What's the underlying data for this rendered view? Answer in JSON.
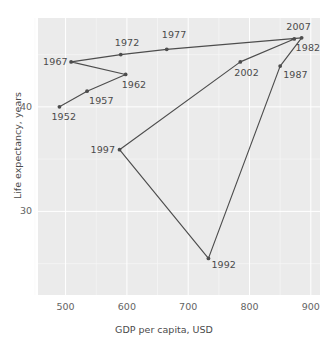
{
  "chart_data": {
    "type": "line",
    "title": "",
    "xlabel": "GDP per capita, USD",
    "ylabel": "Life expectancy, years",
    "xlim": [
      455,
      915
    ],
    "ylim": [
      22.0,
      48.5
    ],
    "xticks": [
      500,
      600,
      700,
      800,
      900
    ],
    "yticks": [
      30,
      40
    ],
    "grid": true,
    "legend": "none",
    "marker": "filled-circle",
    "series_color": "#4d4d4d",
    "plot_background": "#ebebeb",
    "gridline_color": "#ffffff",
    "points": [
      {
        "label": "1952",
        "x": 490,
        "y": 40.0,
        "label_dx": -8,
        "label_dy": 10
      },
      {
        "label": "1957",
        "x": 535,
        "y": 41.5,
        "label_dx": 2,
        "label_dy": 10
      },
      {
        "label": "1962",
        "x": 598,
        "y": 43.1,
        "label_dx": -4,
        "label_dy": 11
      },
      {
        "label": "1967",
        "x": 509,
        "y": 44.3,
        "label_dx": -28,
        "label_dy": 0
      },
      {
        "label": "1972",
        "x": 590,
        "y": 45.0,
        "label_dx": -6,
        "label_dy": -12
      },
      {
        "label": "1977",
        "x": 665,
        "y": 45.5,
        "label_dx": -5,
        "label_dy": -14
      },
      {
        "label": "1982",
        "x": 885,
        "y": 46.6,
        "label_dx": -6,
        "label_dy": 10
      },
      {
        "label": "1987",
        "x": 850,
        "y": 43.9,
        "label_dx": 3,
        "label_dy": 9
      },
      {
        "label": "1992",
        "x": 733,
        "y": 25.5,
        "label_dx": 3,
        "label_dy": 7
      },
      {
        "label": "1997",
        "x": 588,
        "y": 35.9,
        "label_dx": -29,
        "label_dy": 0
      },
      {
        "label": "2002",
        "x": 785,
        "y": 44.3,
        "label_dx": -6,
        "label_dy": 11
      },
      {
        "label": "2007",
        "x": 873,
        "y": 46.5,
        "label_dx": -8,
        "label_dy": -12
      }
    ]
  },
  "axis": {
    "x_tick_labels": [
      "500",
      "600",
      "700",
      "800",
      "900"
    ],
    "y_tick_labels": [
      "30",
      "40"
    ],
    "x_title": "GDP per capita, USD",
    "y_title": "Life expectancy, years"
  }
}
